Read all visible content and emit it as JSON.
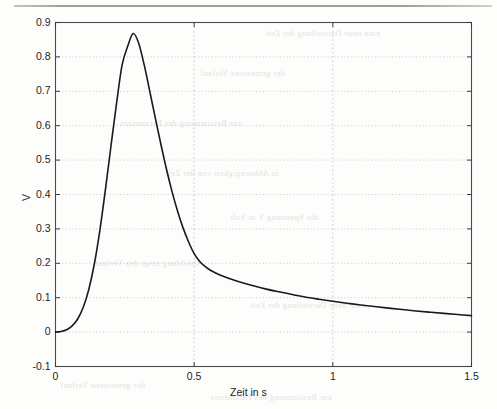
{
  "page": {
    "background_color": "#fdfdfc",
    "scan_rule_color": "#8e8e8b",
    "ghost_text": [
      "eine neue Darstellung der Zeit",
      "der gemessene Verlauf",
      "zur Bestimmung des Parameters",
      "in Abhaengigkeit von der Zeit",
      "die Spannung V in Volt",
      "Abbildung zeigt den Verlauf"
    ]
  },
  "chart_data": {
    "type": "line",
    "title": "",
    "subtitle": "",
    "xlabel": "Zeit in s",
    "ylabel": "V",
    "xlim": [
      0,
      1.5
    ],
    "ylim": [
      -0.1,
      0.9
    ],
    "xticks": [
      0,
      0.5,
      1,
      1.5
    ],
    "xtick_labels": [
      "0",
      "0.5",
      "1",
      "1.5"
    ],
    "yticks": [
      -0.1,
      0,
      0.1,
      0.2,
      0.3,
      0.4,
      0.5,
      0.6,
      0.7,
      0.8,
      0.9
    ],
    "ytick_labels": [
      "-0.1",
      "0",
      "0.1",
      "0.2",
      "0.3",
      "0.4",
      "0.5",
      "0.6",
      "0.7",
      "0.8",
      "0.9"
    ],
    "grid": true,
    "grid_style": "dotted",
    "grid_color": "#bdbdbd",
    "legend": null,
    "line_color": "#1a1a1a",
    "line_width": 1.6,
    "peak_value": 0.868,
    "peak_time": 0.24,
    "series": [
      {
        "name": "V",
        "x": [
          0.0,
          0.02,
          0.04,
          0.06,
          0.08,
          0.1,
          0.12,
          0.14,
          0.16,
          0.18,
          0.2,
          0.22,
          0.24,
          0.26,
          0.28,
          0.3,
          0.32,
          0.34,
          0.36,
          0.38,
          0.4,
          0.42,
          0.44,
          0.46,
          0.48,
          0.5,
          0.52,
          0.54,
          0.56,
          0.58,
          0.6,
          0.64,
          0.68,
          0.72,
          0.76,
          0.8,
          0.85,
          0.9,
          0.95,
          1.0,
          1.05,
          1.1,
          1.15,
          1.2,
          1.25,
          1.3,
          1.35,
          1.4,
          1.45,
          1.5
        ],
        "values": [
          0.0,
          0.002,
          0.007,
          0.018,
          0.038,
          0.072,
          0.124,
          0.198,
          0.296,
          0.414,
          0.541,
          0.664,
          0.776,
          0.83,
          0.868,
          0.84,
          0.776,
          0.7,
          0.622,
          0.546,
          0.474,
          0.409,
          0.352,
          0.303,
          0.262,
          0.228,
          0.205,
          0.19,
          0.179,
          0.171,
          0.164,
          0.152,
          0.142,
          0.133,
          0.125,
          0.118,
          0.11,
          0.102,
          0.0955,
          0.0895,
          0.084,
          0.079,
          0.0742,
          0.0697,
          0.0655,
          0.0615,
          0.0578,
          0.0543,
          0.051,
          0.048
        ]
      }
    ]
  }
}
